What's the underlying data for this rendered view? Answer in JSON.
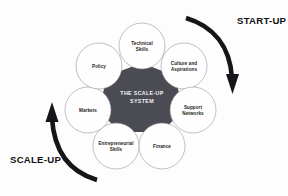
{
  "figure": {
    "title": "The Scale-Up System",
    "background_color": "#fdfdfd",
    "hub_color": "#4b4b53",
    "node_fill_color": "#fefefe",
    "node_stroke_color": "#8e8e96",
    "arrow_color": "#16161a",
    "label_color": "#1c1c20"
  },
  "hub": {
    "line1": "THE SCALE-UP",
    "line2": "SYSTEM",
    "cx": 142,
    "cy": 97
  },
  "nodes": [
    {
      "id": "technical-skills",
      "line1": "Technical",
      "line2": "Skills",
      "cx": 142,
      "cy": 46,
      "r": 23
    },
    {
      "id": "culture-aspirations",
      "line1": "Culture and",
      "line2": "Aspirations",
      "cx": 184,
      "cy": 66,
      "r": 23
    },
    {
      "id": "support-networks",
      "line1": "Support",
      "line2": "Networks",
      "cx": 193,
      "cy": 110,
      "r": 23
    },
    {
      "id": "finance",
      "line1": "Finance",
      "line2": "",
      "cx": 162,
      "cy": 146,
      "r": 23
    },
    {
      "id": "entrepreneurial-skills",
      "line1": "Entrepreneurial",
      "line2": "Skills",
      "cx": 116,
      "cy": 146,
      "r": 23
    },
    {
      "id": "markets",
      "line1": "Markets",
      "line2": "",
      "cx": 88,
      "cy": 110,
      "r": 23
    },
    {
      "id": "policy",
      "line1": "Policy",
      "line2": "",
      "cx": 99,
      "cy": 66,
      "r": 23
    }
  ],
  "phases": [
    {
      "id": "start-up",
      "label": "START-UP",
      "text_x": 237,
      "text_y": 24,
      "direction": "clockwise-descending",
      "arrow_path": "M 186 18 C 213 26 230 46 232 78",
      "arrow_width": 4.6,
      "head_points": "226,74 239,74 232.5,94"
    },
    {
      "id": "scale-up",
      "label": "SCALE-UP",
      "text_x": 10,
      "text_y": 163,
      "direction": "counter-clockwise-ascending",
      "arrow_path": "M 97 180 C 70 172 54 152 52 118",
      "arrow_width": 4.6,
      "head_points": "45.5,122 58.5,122 52,102"
    }
  ]
}
